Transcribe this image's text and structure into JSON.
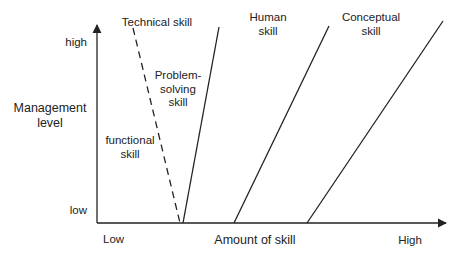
{
  "diagram": {
    "y_axis": {
      "label_line1": "Management",
      "label_line2": "level",
      "tick_high": "high",
      "tick_low": "low"
    },
    "x_axis": {
      "label": "Amount of skill",
      "tick_low": "Low",
      "tick_high": "High"
    },
    "lines": [
      {
        "name": "Technical skill",
        "style": "dashed"
      },
      {
        "name": "Problem-solving skill",
        "style": "solid"
      },
      {
        "name": "Human skill",
        "style": "solid"
      },
      {
        "name": "Conceptual skill",
        "style": "solid"
      }
    ],
    "labels": {
      "technical": "Technical skill",
      "problem_line1": "Problem-",
      "problem_line2": "solving",
      "problem_line3": "skill",
      "functional_line1": "functional",
      "functional_line2": "skill",
      "human_line1": "Human",
      "human_line2": "skill",
      "conceptual_line1": "Conceptual",
      "conceptual_line2": "skill"
    },
    "colors": {
      "line": "#222222",
      "background": "#ffffff"
    }
  }
}
